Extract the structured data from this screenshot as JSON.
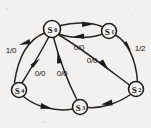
{
  "figure": {
    "kind": "state-transition-diagram",
    "background_color": "#f2f1ef",
    "ink_color": "#211f1c",
    "width": 151,
    "height": 128
  },
  "nodes": [
    {
      "id": "S0",
      "label": "S",
      "sub": "0",
      "cx": 52,
      "cy": 29,
      "r": 8.5
    },
    {
      "id": "S1",
      "label": "S",
      "sub": "1",
      "cx": 109,
      "cy": 31,
      "r": 7.5
    },
    {
      "id": "S2",
      "label": "S",
      "sub": "2",
      "cx": 136,
      "cy": 89,
      "r": 7.5
    },
    {
      "id": "S3",
      "label": "S",
      "sub": "3",
      "cx": 80,
      "cy": 107,
      "r": 7.5
    },
    {
      "id": "S4",
      "label": "S",
      "sub": "4",
      "cx": 19,
      "cy": 90,
      "r": 7.5
    }
  ],
  "edges": [
    {
      "id": "e-s0-s1-top",
      "from": "S0",
      "to": "S1",
      "label": "",
      "label_x": 0,
      "label_y": 0
    },
    {
      "id": "e-s1-s0-back",
      "from": "S1",
      "to": "S0",
      "label": "0/0",
      "label_x": 79,
      "label_y": 47
    },
    {
      "id": "e-s1-s2",
      "from": "S1",
      "to": "S2",
      "label": "1/2",
      "label_x": 140,
      "label_y": 48
    },
    {
      "id": "e-s0-s2",
      "from": "S0",
      "to": "S2",
      "label": "0/0",
      "label_x": 92,
      "label_y": 60
    },
    {
      "id": "e-s2-s3",
      "from": "S2",
      "to": "S3",
      "label": "",
      "label_x": 0,
      "label_y": 0
    },
    {
      "id": "e-s3-s0",
      "from": "S3",
      "to": "S0",
      "label": "0/0",
      "label_x": 62,
      "label_y": 73
    },
    {
      "id": "e-s4-s3",
      "from": "S4",
      "to": "S3",
      "label": "",
      "label_x": 0,
      "label_y": 0
    },
    {
      "id": "e-s4-s0",
      "from": "S4",
      "to": "S0",
      "label": "0/0",
      "label_x": 40,
      "label_y": 73
    },
    {
      "id": "e-s0-s4",
      "from": "S0",
      "to": "S4",
      "label": "1/0",
      "label_x": 11,
      "label_y": 50
    }
  ],
  "edge_labels": [
    {
      "id": "label-1-0",
      "text": "1/0",
      "x": 11,
      "y": 50
    },
    {
      "id": "label-0-0-s1",
      "text": "0/0",
      "x": 79,
      "y": 47
    },
    {
      "id": "label-1-2",
      "text": "1/2",
      "x": 140,
      "y": 48
    },
    {
      "id": "label-0-0-s2",
      "text": "0/0",
      "x": 92,
      "y": 60
    },
    {
      "id": "label-0-0-s4",
      "text": "0/0",
      "x": 40,
      "y": 73
    },
    {
      "id": "label-0-0-s3",
      "text": "0/0",
      "x": 62,
      "y": 73
    }
  ]
}
